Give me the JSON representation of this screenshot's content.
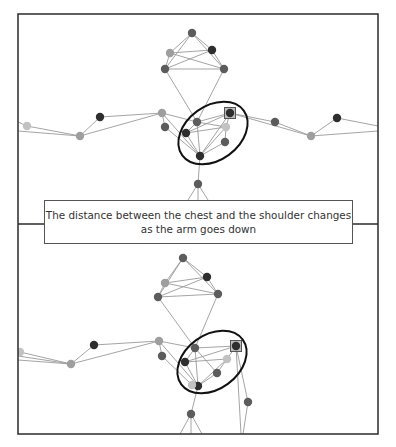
{
  "figure": {
    "caption_lines": [
      "The distance between the chest and the shoulder changes",
      "as the arm goes down"
    ],
    "colors": {
      "frame": "#2b2b2b",
      "bone": "#9a9a9a",
      "ellipse": "#111111",
      "joint_dark": "#2e2e2e",
      "joint_mid": "#5c5c5c",
      "joint_light": "#9e9e9e",
      "joint_pale": "#c2c2c2"
    },
    "panels": [
      {
        "name": "arm-raised",
        "joints": [
          {
            "id": "head_top",
            "x": 192,
            "y": 33,
            "shade": "mid"
          },
          {
            "id": "head_ul",
            "x": 170,
            "y": 53,
            "shade": "light"
          },
          {
            "id": "head_ur",
            "x": 212,
            "y": 50,
            "shade": "dark"
          },
          {
            "id": "head_ll",
            "x": 165,
            "y": 69,
            "shade": "mid"
          },
          {
            "id": "head_lr",
            "x": 224,
            "y": 69,
            "shade": "mid"
          },
          {
            "id": "l_shoulder",
            "x": 162,
            "y": 113,
            "shade": "light"
          },
          {
            "id": "l_shoulder2",
            "x": 165,
            "y": 127,
            "shade": "mid"
          },
          {
            "id": "neck",
            "x": 197,
            "y": 122,
            "shade": "mid"
          },
          {
            "id": "chest_l",
            "x": 186,
            "y": 133,
            "shade": "dark"
          },
          {
            "id": "r_shoulder",
            "x": 230,
            "y": 113,
            "shade": "dark",
            "marked": true
          },
          {
            "id": "chest_r",
            "x": 226,
            "y": 127,
            "shade": "pale"
          },
          {
            "id": "chest_r2",
            "x": 225,
            "y": 142,
            "shade": "mid"
          },
          {
            "id": "chest_bottom",
            "x": 200,
            "y": 156,
            "shade": "dark"
          },
          {
            "id": "spine",
            "x": 198,
            "y": 184,
            "shade": "mid"
          },
          {
            "id": "l_elbow",
            "x": 100,
            "y": 117,
            "shade": "dark"
          },
          {
            "id": "l_wrist",
            "x": 80,
            "y": 136,
            "shade": "light"
          },
          {
            "id": "l_hand",
            "x": 27,
            "y": 126,
            "shade": "pale"
          },
          {
            "id": "r_elbow",
            "x": 275,
            "y": 122,
            "shade": "mid"
          },
          {
            "id": "r_wrist",
            "x": 311,
            "y": 136,
            "shade": "light"
          },
          {
            "id": "r_hand",
            "x": 337,
            "y": 118,
            "shade": "dark"
          }
        ],
        "bones": [
          [
            "head_top",
            "head_ul"
          ],
          [
            "head_top",
            "head_ur"
          ],
          [
            "head_top",
            "head_ll"
          ],
          [
            "head_top",
            "head_lr"
          ],
          [
            "head_ul",
            "head_ur"
          ],
          [
            "head_ul",
            "head_lr"
          ],
          [
            "head_ll",
            "head_ur"
          ],
          [
            "head_ll",
            "head_lr"
          ],
          [
            "head_ul",
            "head_ll"
          ],
          [
            "head_ur",
            "head_lr"
          ],
          [
            "head_ll",
            "neck"
          ],
          [
            "head_lr",
            "neck"
          ],
          [
            "neck",
            "l_shoulder"
          ],
          [
            "neck",
            "r_shoulder"
          ],
          [
            "neck",
            "chest_bottom"
          ],
          [
            "neck",
            "chest_l"
          ],
          [
            "neck",
            "chest_r"
          ],
          [
            "l_shoulder",
            "l_shoulder2"
          ],
          [
            "l_shoulder",
            "chest_bottom"
          ],
          [
            "l_shoulder2",
            "chest_bottom"
          ],
          [
            "chest_l",
            "chest_bottom"
          ],
          [
            "chest_l",
            "r_shoulder"
          ],
          [
            "chest_l",
            "chest_r"
          ],
          [
            "r_shoulder",
            "chest_r"
          ],
          [
            "r_shoulder",
            "chest_bottom"
          ],
          [
            "chest_r",
            "chest_bottom"
          ],
          [
            "chest_r2",
            "chest_bottom"
          ],
          [
            "chest_r",
            "chest_r2"
          ],
          [
            "l_shoulder",
            "l_elbow"
          ],
          [
            "l_shoulder",
            "l_wrist"
          ],
          [
            "l_elbow",
            "l_wrist"
          ],
          [
            "l_wrist",
            "l_hand"
          ],
          [
            "r_shoulder",
            "r_elbow"
          ],
          [
            "r_shoulder",
            "r_wrist"
          ],
          [
            "r_elbow",
            "r_wrist"
          ],
          [
            "r_wrist",
            "r_hand"
          ],
          [
            "chest_bottom",
            "spine"
          ]
        ],
        "edge_lines": [
          {
            "x1": 18,
            "y1": 122,
            "x2": 27,
            "y2": 126
          },
          {
            "x1": 18,
            "y1": 131,
            "x2": 80,
            "y2": 136
          },
          {
            "x1": 337,
            "y1": 118,
            "x2": 378,
            "y2": 126
          },
          {
            "x1": 311,
            "y1": 136,
            "x2": 378,
            "y2": 131
          },
          {
            "x1": 198,
            "y1": 184,
            "x2": 188,
            "y2": 200
          },
          {
            "x1": 198,
            "y1": 184,
            "x2": 208,
            "y2": 200
          },
          {
            "x1": 198,
            "y1": 184,
            "x2": 198,
            "y2": 200
          }
        ],
        "ellipse": {
          "cx": 213,
          "cy": 133,
          "rx": 38,
          "ry": 27,
          "rotate": -36
        },
        "clip": {
          "x": 18,
          "y": 14,
          "w": 360,
          "h": 186
        }
      },
      {
        "name": "arm-lowered",
        "joints": [
          {
            "id": "head_top",
            "x": 183,
            "y": 258,
            "shade": "mid"
          },
          {
            "id": "head_ul",
            "x": 165,
            "y": 283,
            "shade": "light"
          },
          {
            "id": "head_ur",
            "x": 207,
            "y": 277,
            "shade": "dark"
          },
          {
            "id": "head_ll",
            "x": 158,
            "y": 297,
            "shade": "mid"
          },
          {
            "id": "head_lr",
            "x": 218,
            "y": 294,
            "shade": "mid"
          },
          {
            "id": "l_shoulder",
            "x": 159,
            "y": 341,
            "shade": "light"
          },
          {
            "id": "l_shoulder2",
            "x": 162,
            "y": 356,
            "shade": "mid"
          },
          {
            "id": "neck",
            "x": 195,
            "y": 348,
            "shade": "mid"
          },
          {
            "id": "chest_l",
            "x": 185,
            "y": 362,
            "shade": "dark"
          },
          {
            "id": "r_shoulder",
            "x": 236,
            "y": 346,
            "shade": "dark",
            "marked": true
          },
          {
            "id": "chest_r",
            "x": 227,
            "y": 359,
            "shade": "pale"
          },
          {
            "id": "chest_r2",
            "x": 217,
            "y": 373,
            "shade": "mid"
          },
          {
            "id": "chest_bottom",
            "x": 198,
            "y": 386,
            "shade": "dark"
          },
          {
            "id": "chest_b2",
            "x": 192,
            "y": 385,
            "shade": "pale"
          },
          {
            "id": "spine",
            "x": 191,
            "y": 414,
            "shade": "mid"
          },
          {
            "id": "l_elbow",
            "x": 94,
            "y": 345,
            "shade": "dark"
          },
          {
            "id": "l_wrist",
            "x": 71,
            "y": 364,
            "shade": "light"
          },
          {
            "id": "l_hand",
            "x": 20,
            "y": 352,
            "shade": "pale"
          },
          {
            "id": "r_elbow",
            "x": 248,
            "y": 402,
            "shade": "mid"
          }
        ],
        "bones": [
          [
            "head_top",
            "head_ul"
          ],
          [
            "head_top",
            "head_ur"
          ],
          [
            "head_top",
            "head_ll"
          ],
          [
            "head_top",
            "head_lr"
          ],
          [
            "head_ul",
            "head_ur"
          ],
          [
            "head_ul",
            "head_lr"
          ],
          [
            "head_ll",
            "head_ur"
          ],
          [
            "head_ll",
            "head_lr"
          ],
          [
            "head_ul",
            "head_ll"
          ],
          [
            "head_ur",
            "head_lr"
          ],
          [
            "head_ll",
            "neck"
          ],
          [
            "head_lr",
            "neck"
          ],
          [
            "neck",
            "l_shoulder"
          ],
          [
            "neck",
            "r_shoulder"
          ],
          [
            "neck",
            "chest_bottom"
          ],
          [
            "neck",
            "chest_l"
          ],
          [
            "neck",
            "chest_r2"
          ],
          [
            "l_shoulder",
            "l_shoulder2"
          ],
          [
            "l_shoulder",
            "chest_bottom"
          ],
          [
            "l_shoulder2",
            "chest_b2"
          ],
          [
            "chest_l",
            "chest_bottom"
          ],
          [
            "chest_l",
            "r_shoulder"
          ],
          [
            "chest_l",
            "chest_r"
          ],
          [
            "r_shoulder",
            "chest_r"
          ],
          [
            "chest_r",
            "chest_bottom"
          ],
          [
            "chest_r2",
            "chest_bottom"
          ],
          [
            "chest_r",
            "chest_r2"
          ],
          [
            "chest_b2",
            "chest_bottom"
          ],
          [
            "l_shoulder",
            "l_elbow"
          ],
          [
            "l_shoulder",
            "l_wrist"
          ],
          [
            "l_elbow",
            "l_wrist"
          ],
          [
            "l_wrist",
            "l_hand"
          ],
          [
            "r_shoulder",
            "r_elbow"
          ],
          [
            "chest_bottom",
            "spine"
          ]
        ],
        "edge_lines": [
          {
            "x1": 18,
            "y1": 356,
            "x2": 71,
            "y2": 364
          },
          {
            "x1": 18,
            "y1": 360,
            "x2": 71,
            "y2": 364
          },
          {
            "x1": 236,
            "y1": 346,
            "x2": 241,
            "y2": 434
          },
          {
            "x1": 248,
            "y1": 402,
            "x2": 243,
            "y2": 434
          },
          {
            "x1": 191,
            "y1": 414,
            "x2": 180,
            "y2": 434
          },
          {
            "x1": 191,
            "y1": 414,
            "x2": 202,
            "y2": 434
          },
          {
            "x1": 191,
            "y1": 414,
            "x2": 191,
            "y2": 434
          }
        ],
        "ellipse": {
          "cx": 212,
          "cy": 362,
          "rx": 38,
          "ry": 27,
          "rotate": -36
        },
        "clip": {
          "x": 18,
          "y": 224,
          "w": 360,
          "h": 210
        }
      }
    ]
  }
}
